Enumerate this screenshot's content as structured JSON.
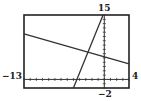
{
  "chart_data": {
    "type": "line",
    "title": "",
    "xlabel": "",
    "ylabel": "",
    "xlim": [
      -13,
      4
    ],
    "ylim": [
      -2,
      15
    ],
    "window_labels": {
      "xmin": "−13",
      "xmax": "4",
      "ymin": "−2",
      "ymax": "15"
    },
    "grid": false,
    "axes_tick_marks": true,
    "series": [
      {
        "name": "shallow line",
        "points": [
          [
            -13,
            10.6
          ],
          [
            4,
            3.6
          ]
        ]
      },
      {
        "name": "steep line",
        "points": [
          [
            -5.0,
            -2
          ],
          [
            -0.2,
            15
          ]
        ]
      }
    ],
    "intersection": [
      -2.5,
      6.2
    ],
    "colors": {
      "frame": "#222222",
      "lines": "#333333",
      "background": "#ffffff"
    }
  }
}
